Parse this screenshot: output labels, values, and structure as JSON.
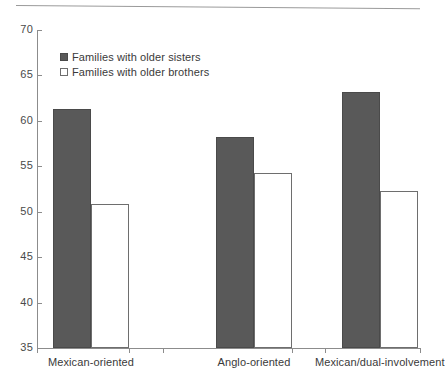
{
  "chart_data": {
    "type": "bar",
    "title": "",
    "subtitle": "",
    "xlabel": "",
    "ylabel": "",
    "ylim": [
      35,
      70
    ],
    "yticks": [
      35,
      40,
      45,
      50,
      55,
      60,
      65,
      70
    ],
    "ytick_labels": [
      "35",
      "40",
      "45",
      "50",
      "55",
      "60",
      "65",
      "70"
    ],
    "grid": false,
    "legend_position": "upper-left",
    "categories": [
      "Mexican-oriented",
      "Anglo-oriented",
      "Mexican/dual-involvement"
    ],
    "series": [
      {
        "name": "Families with older sisters",
        "color": "#595959",
        "values": [
          61.3,
          58.2,
          63.2
        ]
      },
      {
        "name": "Families with older brothers",
        "color": "#ffffff",
        "values": [
          50.9,
          54.3,
          52.3
        ]
      }
    ]
  },
  "legend": {
    "items": [
      {
        "label": "Families with older sisters",
        "swatch": "dark"
      },
      {
        "label": "Families with older brothers",
        "swatch": "light"
      }
    ]
  },
  "axes": {
    "y_tick_labels": [
      "70",
      "65",
      "60",
      "55",
      "50",
      "45",
      "40",
      "35"
    ],
    "x_tick_labels": [
      "Mexican-oriented",
      "Anglo-oriented",
      "Mexican/dual-involvement"
    ]
  }
}
